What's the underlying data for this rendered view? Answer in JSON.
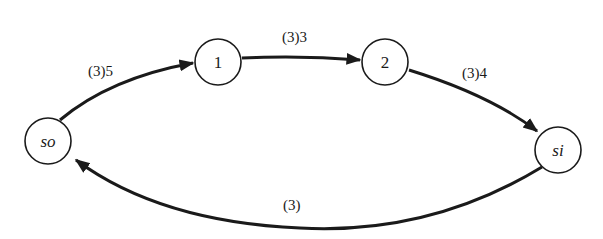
{
  "diagram": {
    "type": "flow-network",
    "nodes": [
      {
        "id": "so",
        "label": "so",
        "italic": true
      },
      {
        "id": "1",
        "label": "1",
        "italic": false
      },
      {
        "id": "2",
        "label": "2",
        "italic": false
      },
      {
        "id": "si",
        "label": "si",
        "italic": true
      }
    ],
    "edges": [
      {
        "from": "so",
        "to": "1",
        "label": "(3)5"
      },
      {
        "from": "1",
        "to": "2",
        "label": "(3)3"
      },
      {
        "from": "2",
        "to": "si",
        "label": "(3)4"
      },
      {
        "from": "si",
        "to": "so",
        "label": "(3)"
      }
    ],
    "colors": {
      "stroke": "#1a1a1a",
      "background": "#ffffff"
    }
  }
}
